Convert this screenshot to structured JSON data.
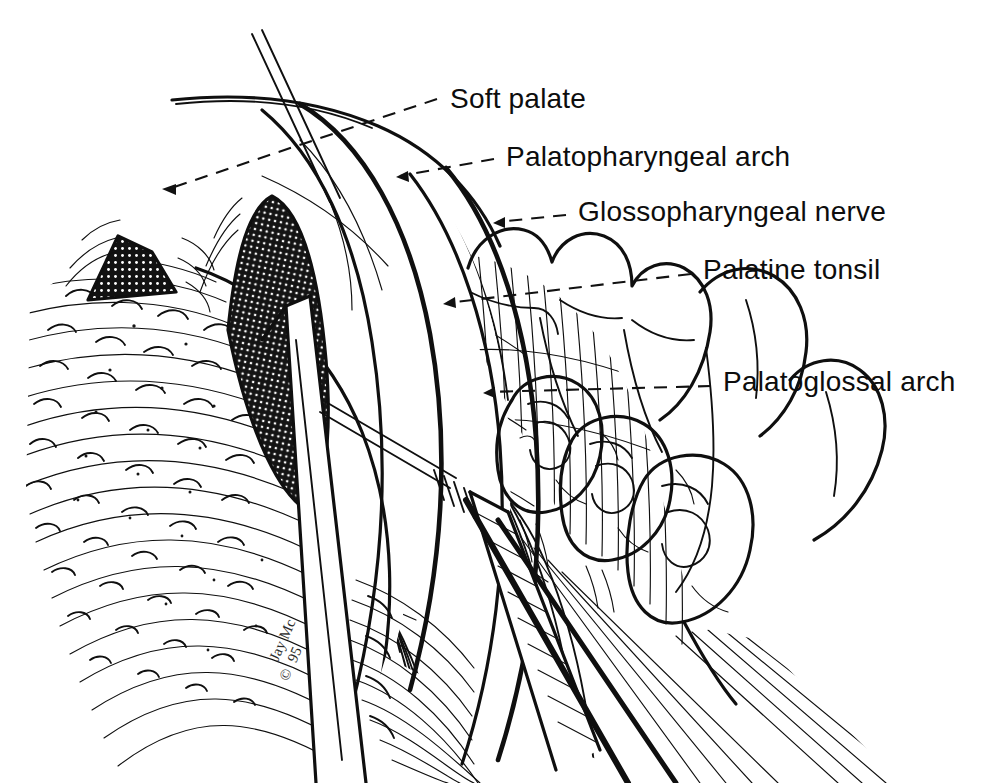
{
  "figure": {
    "background_color": "#ffffff",
    "ink_color": "#0f0f0f",
    "width": 987,
    "height": 783,
    "style": "pen-and-ink line drawing with cross-hatching"
  },
  "labels": [
    {
      "id": "soft-palate",
      "text": "Soft palate",
      "text_x": 450,
      "text_y": 108,
      "leader": {
        "x1": 437,
        "y1": 99,
        "x2": 168,
        "y2": 189
      },
      "arrow_x": 166,
      "arrow_y": 189
    },
    {
      "id": "palatopharyngeal-arch",
      "text": "Palatopharyngeal arch",
      "text_x": 506,
      "text_y": 166,
      "leader": {
        "x1": 494,
        "y1": 159,
        "x2": 400,
        "y2": 176
      },
      "arrow_x": 399,
      "arrow_y": 176
    },
    {
      "id": "glossopharyngeal-nerve",
      "text": "Glossopharyngeal nerve",
      "text_x": 578,
      "text_y": 221,
      "leader": {
        "x1": 566,
        "y1": 215,
        "x2": 497,
        "y2": 222
      },
      "arrow_x": 496,
      "arrow_y": 222
    },
    {
      "id": "palatine-tonsil",
      "text": "Palatine tonsil",
      "text_x": 703,
      "text_y": 279,
      "leader": {
        "x1": 691,
        "y1": 274,
        "x2": 447,
        "y2": 303
      },
      "arrow_x": 446,
      "arrow_y": 303
    },
    {
      "id": "palatoglossal-arch",
      "text": "Palatoglossal arch",
      "text_x": 723,
      "text_y": 391,
      "leader": {
        "x1": 711,
        "y1": 386,
        "x2": 487,
        "y2": 392
      },
      "arrow_x": 486,
      "arrow_y": 392
    }
  ],
  "signature": {
    "artist_initials": "Jay Mc",
    "year": "95",
    "copyright_mark": "©",
    "x": 278,
    "y": 662
  },
  "structures": [
    {
      "name": "tongue-dorsum",
      "description": "left tongue body with curved papillae hatching"
    },
    {
      "name": "vallate-papilla-left",
      "description": "dark cross-hatched triangular crypt, left"
    },
    {
      "name": "vallate-papilla-right",
      "description": "dark cross-hatched triangular crypt, center"
    },
    {
      "name": "soft-palate",
      "description": "upper curved palate edge"
    },
    {
      "name": "palatopharyngeal-arch",
      "description": "vertical hatched mucosal ridge"
    },
    {
      "name": "palatoglossal-arch",
      "description": "anterior hatched mucosal fold"
    },
    {
      "name": "palatine-tonsil",
      "description": "lobulated tonsil mass near teeth"
    },
    {
      "name": "upper-molars",
      "description": "three upper molar crowns, right"
    },
    {
      "name": "lower-molars",
      "description": "three lower molar crowns with occlusal cusps"
    },
    {
      "name": "retractor-blade",
      "description": "long straight surgical retractor blade, diagonal"
    },
    {
      "name": "dissector-instrument",
      "description": "shafted tonsil dissector with ribbed handle"
    },
    {
      "name": "needle-probe",
      "description": "thin needle entering from top-left"
    }
  ]
}
